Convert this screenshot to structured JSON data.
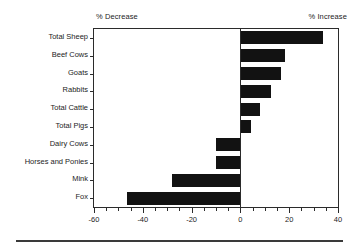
{
  "chart_data": {
    "type": "bar",
    "orientation": "horizontal",
    "title": "",
    "subtitle": "",
    "xlabel": "",
    "ylabel": "",
    "left_caption": "% Decrease",
    "right_caption": "% Increase",
    "categories": [
      "Total Sheep",
      "Beef Cows",
      "Goats",
      "Rabbits",
      "Total Cattle",
      "Total Pigs",
      "Dairy Cows",
      "Horses and Ponies",
      "Mink",
      "Fox"
    ],
    "values": [
      33.7,
      18.3,
      16.7,
      12.6,
      8.1,
      4.5,
      -10.2,
      -10.2,
      -28.0,
      -46.5
    ],
    "xlim": [
      -60,
      40
    ],
    "ylim": null,
    "xticks": [
      -60,
      -40,
      -20,
      0,
      20,
      40
    ],
    "xticklabels": [
      "-60",
      "-40",
      "-20",
      "0",
      "20",
      "40"
    ],
    "minor_tick_step": 5,
    "grid": false,
    "legend": null,
    "bar_color": "#121212",
    "axis_color": "#2b2b2b",
    "background": "#ffffff"
  }
}
